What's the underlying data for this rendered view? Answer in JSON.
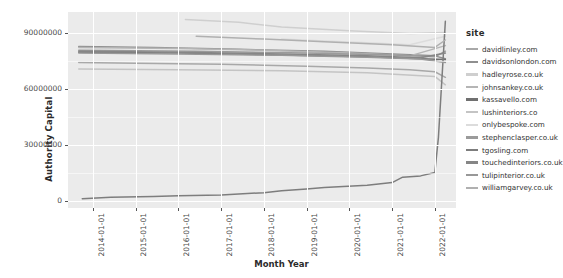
{
  "chart_data": {
    "type": "line",
    "title": "",
    "xlabel": "Month Year",
    "ylabel": "Authority Capital",
    "legend_title": "site",
    "legend_position": "right",
    "grid": true,
    "x_tick_labels": [
      "2014-01-01",
      "2015-01-01",
      "2016-01-01",
      "2017-01-01",
      "2018-01-01",
      "2019-01-01",
      "2020-01-01",
      "2021-01-01",
      "2022-01-01"
    ],
    "y_tick_labels": [
      "0",
      "30000000",
      "60000000",
      "90000000"
    ],
    "y_tick_values": [
      0,
      30000000,
      60000000,
      90000000
    ],
    "ylim": [
      -4000000,
      101000000
    ],
    "xlim": [
      "2013-06-01",
      "2022-07-01"
    ],
    "series": [
      {
        "name": "davidlinley.com",
        "color": "#a8a8a8",
        "x": [
          "2013-09-01",
          "2015-01-01",
          "2017-01-01",
          "2019-01-01",
          "2020-06-01",
          "2021-06-01",
          "2022-01-01",
          "2022-04-01"
        ],
        "values": [
          74000000,
          73500000,
          73000000,
          72000000,
          71000000,
          70000000,
          69000000,
          66000000
        ]
      },
      {
        "name": "davidsonlondon.com",
        "color": "#8f8f8f",
        "x": [
          "2013-09-01",
          "2015-06-01",
          "2017-06-01",
          "2019-06-01",
          "2021-01-01",
          "2022-01-01",
          "2022-04-01"
        ],
        "values": [
          82500000,
          82000000,
          81000000,
          80000000,
          78500000,
          77500000,
          76000000
        ]
      },
      {
        "name": "hadleyrose.co.uk",
        "color": "#cfcfcf",
        "x": [
          "2016-03-01",
          "2017-06-01",
          "2018-06-01",
          "2020-01-01",
          "2021-06-01",
          "2022-04-01"
        ],
        "values": [
          97000000,
          95500000,
          93000000,
          91000000,
          89500000,
          90000000
        ]
      },
      {
        "name": "johnsankey.co.uk",
        "color": "#b5b5b5",
        "x": [
          "2013-09-01",
          "2016-01-01",
          "2018-01-01",
          "2020-01-01",
          "2021-06-01",
          "2022-04-01"
        ],
        "values": [
          82000000,
          81500000,
          80500000,
          79000000,
          77500000,
          83000000
        ]
      },
      {
        "name": "kassavello.com",
        "color": "#707070",
        "x": [
          "2013-09-01",
          "2016-01-01",
          "2018-06-01",
          "2020-06-01",
          "2021-09-01",
          "2022-04-01"
        ],
        "values": [
          79500000,
          79000000,
          78000000,
          77000000,
          76000000,
          75500000
        ]
      },
      {
        "name": "lushinteriors.co",
        "color": "#c4c4c4",
        "x": [
          "2013-09-01",
          "2016-01-01",
          "2018-06-01",
          "2020-06-01",
          "2022-01-01",
          "2022-04-01"
        ],
        "values": [
          70500000,
          70000000,
          69500000,
          68500000,
          66500000,
          62000000
        ]
      },
      {
        "name": "onlybespoke.com",
        "color": "#dcdcdc",
        "x": [
          "2018-06-01",
          "2019-06-01",
          "2020-06-01",
          "2021-06-01",
          "2022-04-01"
        ],
        "values": [
          86500000,
          85500000,
          84500000,
          83500000,
          88000000
        ]
      },
      {
        "name": "stephenclasper.co.uk",
        "color": "#9b9b9b",
        "x": [
          "2013-09-01",
          "2016-06-01",
          "2019-01-01",
          "2021-01-01",
          "2022-01-01",
          "2022-04-01"
        ],
        "values": [
          80500000,
          80000000,
          79000000,
          78000000,
          77000000,
          80000000
        ]
      },
      {
        "name": "tgosling.com",
        "color": "#7d7d7d",
        "x": [
          "2013-10-01",
          "2014-06-01",
          "2015-06-01",
          "2016-01-01",
          "2017-01-01",
          "2018-01-01",
          "2018-06-01",
          "2019-01-01",
          "2019-06-01",
          "2020-06-01",
          "2021-01-01",
          "2021-04-01",
          "2021-09-01",
          "2022-01-01",
          "2022-02-01",
          "2022-04-01"
        ],
        "values": [
          1000000,
          1800000,
          2200000,
          2600000,
          3000000,
          4200000,
          5200000,
          6200000,
          7000000,
          8200000,
          9600000,
          12500000,
          13200000,
          15000000,
          34000000,
          96000000
        ]
      },
      {
        "name": "touchedinteriors.co.uk",
        "color": "#868686",
        "x": [
          "2013-09-01",
          "2016-01-01",
          "2018-06-01",
          "2020-06-01",
          "2021-09-01",
          "2022-04-01"
        ],
        "values": [
          80000000,
          79500000,
          78500000,
          77500000,
          76500000,
          79000000
        ]
      },
      {
        "name": "tulipinterior.co.uk",
        "color": "#989898",
        "x": [
          "2013-09-01",
          "2016-01-01",
          "2018-06-01",
          "2020-06-01",
          "2021-09-01",
          "2022-04-01"
        ],
        "values": [
          79000000,
          78500000,
          77800000,
          76800000,
          75800000,
          74000000
        ]
      },
      {
        "name": "williamgarvey.co.uk",
        "color": "#b0b0b0",
        "x": [
          "2016-06-01",
          "2018-01-01",
          "2019-06-01",
          "2021-01-01",
          "2022-01-01",
          "2022-04-01"
        ],
        "values": [
          88000000,
          86500000,
          85000000,
          83500000,
          82000000,
          86000000
        ]
      }
    ]
  }
}
